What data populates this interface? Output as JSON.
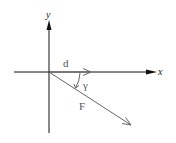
{
  "diagram": {
    "type": "vector-diagram",
    "colors": {
      "axis": "#111111",
      "vector": "#666666",
      "label": "#555555"
    },
    "axes": {
      "x_label": "x",
      "y_label": "y"
    },
    "vectors": [
      {
        "id": "d",
        "label": "d",
        "direction": "along positive x-axis"
      },
      {
        "id": "F",
        "label": "F",
        "direction": "down-right from origin"
      }
    ],
    "angle": {
      "label": "γ",
      "between": [
        "d",
        "F"
      ]
    }
  }
}
